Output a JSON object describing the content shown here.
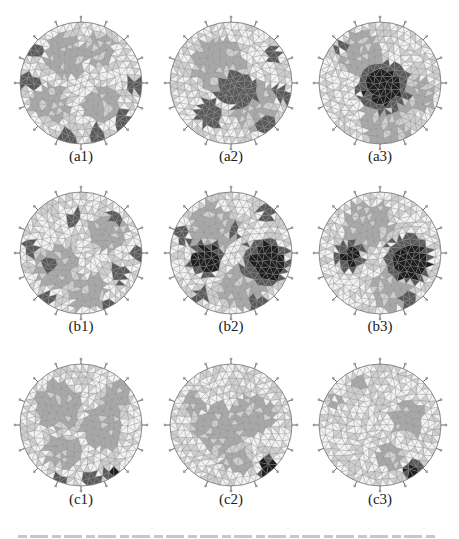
{
  "figure": {
    "colors": {
      "background": "#ffffff",
      "mesh_line": "#8a8a8a",
      "low": "#f2f2f2",
      "mid_light": "#cfcfcf",
      "mid": "#a9a9a9",
      "dark": "#5a5a5a",
      "darkest": "#1e1e1e",
      "label": "#222222"
    },
    "electrodes_per_ring": 16,
    "panels": [
      {
        "id": "a1",
        "label": "(a1)",
        "row": 0,
        "col": 0,
        "regions": [
          {
            "shade": "mid",
            "cx": -0.25,
            "cy": -0.45,
            "r": 0.35
          },
          {
            "shade": "mid",
            "cx": 0.3,
            "cy": -0.55,
            "r": 0.25
          },
          {
            "shade": "mid",
            "cx": -0.5,
            "cy": 0.35,
            "r": 0.3
          },
          {
            "shade": "mid",
            "cx": 0.35,
            "cy": 0.35,
            "r": 0.3
          },
          {
            "shade": "dark",
            "cx": -0.85,
            "cy": -0.05,
            "r": 0.16
          },
          {
            "shade": "dark",
            "cx": -0.75,
            "cy": -0.55,
            "r": 0.12
          },
          {
            "shade": "dark",
            "cx": 0.85,
            "cy": 0.05,
            "r": 0.13
          },
          {
            "shade": "dark",
            "cx": 0.7,
            "cy": 0.65,
            "r": 0.15
          },
          {
            "shade": "dark",
            "cx": -0.2,
            "cy": 0.9,
            "r": 0.14
          },
          {
            "shade": "dark",
            "cx": 0.25,
            "cy": 0.85,
            "r": 0.14
          }
        ]
      },
      {
        "id": "a2",
        "label": "(a2)",
        "row": 0,
        "col": 1,
        "regions": [
          {
            "shade": "mid",
            "cx": -0.2,
            "cy": -0.3,
            "r": 0.45
          },
          {
            "shade": "mid",
            "cx": 0.4,
            "cy": 0.4,
            "r": 0.4
          },
          {
            "shade": "dark",
            "cx": 0.1,
            "cy": 0.1,
            "r": 0.32
          },
          {
            "shade": "dark",
            "cx": -0.35,
            "cy": 0.5,
            "r": 0.22
          },
          {
            "shade": "dark",
            "cx": 0.6,
            "cy": 0.7,
            "r": 0.18
          },
          {
            "shade": "dark",
            "cx": 0.85,
            "cy": 0.2,
            "r": 0.14
          },
          {
            "shade": "dark",
            "cx": 0.7,
            "cy": -0.45,
            "r": 0.12
          }
        ]
      },
      {
        "id": "a3",
        "label": "(a3)",
        "row": 0,
        "col": 2,
        "regions": [
          {
            "shade": "mid",
            "cx": -0.3,
            "cy": -0.5,
            "r": 0.35
          },
          {
            "shade": "mid",
            "cx": 0.1,
            "cy": 0.6,
            "r": 0.4
          },
          {
            "shade": "mid",
            "cx": 0.6,
            "cy": 0.2,
            "r": 0.3
          },
          {
            "shade": "dark",
            "cx": 0.05,
            "cy": 0.05,
            "r": 0.42
          },
          {
            "shade": "darkest",
            "cx": 0.05,
            "cy": 0.05,
            "r": 0.3
          },
          {
            "shade": "dark",
            "cx": -0.65,
            "cy": -0.6,
            "r": 0.1
          }
        ]
      },
      {
        "id": "b1",
        "label": "(b1)",
        "row": 1,
        "col": 0,
        "regions": [
          {
            "shade": "mid",
            "cx": -0.4,
            "cy": 0.25,
            "r": 0.35
          },
          {
            "shade": "mid",
            "cx": 0.45,
            "cy": -0.35,
            "r": 0.3
          },
          {
            "shade": "mid",
            "cx": 0.1,
            "cy": 0.65,
            "r": 0.3
          },
          {
            "shade": "dark",
            "cx": -0.1,
            "cy": -0.55,
            "r": 0.13
          },
          {
            "shade": "dark",
            "cx": 0.55,
            "cy": -0.6,
            "r": 0.13
          },
          {
            "shade": "dark",
            "cx": -0.5,
            "cy": 0.2,
            "r": 0.13
          },
          {
            "shade": "dark",
            "cx": 0.6,
            "cy": 0.35,
            "r": 0.14
          },
          {
            "shade": "dark",
            "cx": -0.85,
            "cy": -0.1,
            "r": 0.12
          },
          {
            "shade": "dark",
            "cx": -0.6,
            "cy": 0.75,
            "r": 0.13
          },
          {
            "shade": "dark",
            "cx": 0.45,
            "cy": 0.85,
            "r": 0.12
          },
          {
            "shade": "dark",
            "cx": 0.92,
            "cy": 0.0,
            "r": 0.1
          }
        ]
      },
      {
        "id": "b2",
        "label": "(b2)",
        "row": 1,
        "col": 1,
        "regions": [
          {
            "shade": "mid",
            "cx": -0.3,
            "cy": -0.4,
            "r": 0.4
          },
          {
            "shade": "mid",
            "cx": 0.2,
            "cy": 0.6,
            "r": 0.35
          },
          {
            "shade": "dark",
            "cx": -0.4,
            "cy": 0.1,
            "r": 0.28
          },
          {
            "shade": "darkest",
            "cx": -0.4,
            "cy": 0.1,
            "r": 0.2
          },
          {
            "shade": "dark",
            "cx": 0.55,
            "cy": 0.15,
            "r": 0.38
          },
          {
            "shade": "darkest",
            "cx": 0.6,
            "cy": 0.15,
            "r": 0.28
          },
          {
            "shade": "dark",
            "cx": 0.6,
            "cy": -0.65,
            "r": 0.14
          },
          {
            "shade": "dark",
            "cx": -0.8,
            "cy": -0.3,
            "r": 0.12
          },
          {
            "shade": "dark",
            "cx": 0.05,
            "cy": -0.35,
            "r": 0.12
          },
          {
            "shade": "dark",
            "cx": -0.5,
            "cy": 0.7,
            "r": 0.12
          },
          {
            "shade": "dark",
            "cx": 0.45,
            "cy": 0.85,
            "r": 0.12
          }
        ]
      },
      {
        "id": "b3",
        "label": "(b3)",
        "row": 1,
        "col": 2,
        "regions": [
          {
            "shade": "mid",
            "cx": -0.2,
            "cy": -0.45,
            "r": 0.4
          },
          {
            "shade": "mid",
            "cx": 0.2,
            "cy": 0.6,
            "r": 0.35
          },
          {
            "shade": "dark",
            "cx": -0.5,
            "cy": 0.05,
            "r": 0.24
          },
          {
            "shade": "darkest",
            "cx": -0.5,
            "cy": 0.05,
            "r": 0.14
          },
          {
            "shade": "dark",
            "cx": 0.45,
            "cy": 0.1,
            "r": 0.38
          },
          {
            "shade": "darkest",
            "cx": 0.5,
            "cy": 0.15,
            "r": 0.28
          },
          {
            "shade": "dark",
            "cx": 0.45,
            "cy": 0.8,
            "r": 0.1
          }
        ]
      },
      {
        "id": "c1",
        "label": "(c1)",
        "row": 2,
        "col": 0,
        "regions": [
          {
            "shade": "mid",
            "cx": -0.35,
            "cy": -0.3,
            "r": 0.4
          },
          {
            "shade": "mid",
            "cx": 0.35,
            "cy": 0.05,
            "r": 0.35
          },
          {
            "shade": "mid",
            "cx": -0.3,
            "cy": 0.45,
            "r": 0.3
          },
          {
            "shade": "mid",
            "cx": 0.6,
            "cy": -0.5,
            "r": 0.2
          },
          {
            "shade": "dark",
            "cx": 0.15,
            "cy": 0.9,
            "r": 0.14
          },
          {
            "shade": "dark",
            "cx": 0.5,
            "cy": 0.82,
            "r": 0.13
          },
          {
            "shade": "dark",
            "cx": -0.35,
            "cy": 0.92,
            "r": 0.1
          },
          {
            "shade": "darkest",
            "cx": 0.55,
            "cy": 0.8,
            "r": 0.08
          }
        ]
      },
      {
        "id": "c2",
        "label": "(c2)",
        "row": 2,
        "col": 1,
        "regions": [
          {
            "shade": "mid",
            "cx": -0.2,
            "cy": 0.05,
            "r": 0.4
          },
          {
            "shade": "mid",
            "cx": 0.35,
            "cy": -0.15,
            "r": 0.35
          },
          {
            "shade": "mid",
            "cx": -0.6,
            "cy": -0.4,
            "r": 0.18
          },
          {
            "shade": "mid",
            "cx": 0.1,
            "cy": 0.6,
            "r": 0.22
          },
          {
            "shade": "dark",
            "cx": 0.6,
            "cy": 0.72,
            "r": 0.18
          },
          {
            "shade": "darkest",
            "cx": 0.6,
            "cy": 0.72,
            "r": 0.12
          }
        ]
      },
      {
        "id": "c3",
        "label": "(c3)",
        "row": 2,
        "col": 2,
        "regions": [
          {
            "shade": "mid",
            "cx": 0.45,
            "cy": -0.1,
            "r": 0.28
          },
          {
            "shade": "mid",
            "cx": 0.15,
            "cy": 0.5,
            "r": 0.22
          },
          {
            "shade": "mid",
            "cx": -0.35,
            "cy": -0.7,
            "r": 0.12
          },
          {
            "shade": "mid",
            "cx": -0.75,
            "cy": -0.35,
            "r": 0.1
          },
          {
            "shade": "dark",
            "cx": 0.55,
            "cy": 0.75,
            "r": 0.17
          },
          {
            "shade": "darkest",
            "cx": 0.55,
            "cy": 0.77,
            "r": 0.11
          }
        ]
      }
    ],
    "layout": {
      "col_centers_x": [
        81,
        231,
        380
      ],
      "row_centers_y": [
        83,
        253,
        425
      ],
      "radius": 61,
      "label_y": [
        155,
        325,
        498
      ]
    }
  }
}
